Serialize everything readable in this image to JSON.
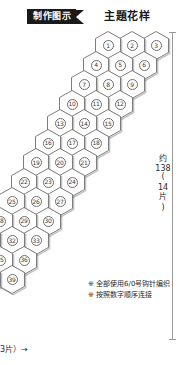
{
  "header": {
    "banner_label": "制作图示",
    "title": "主題花样"
  },
  "diagram": {
    "type": "hexagon-motif-grid",
    "cells_per_row": 3,
    "total_cells": 40,
    "row_x_step": -12,
    "row_y_step": 19.5,
    "hex_width": 25,
    "hex_height": 28,
    "origin_x": 143,
    "origin_y": 31,
    "col_x_step": -24,
    "rows": [
      {
        "index": 0,
        "numbers": [
          "3",
          "2",
          "1"
        ]
      },
      {
        "index": 1,
        "numbers": [
          "6",
          "5",
          "4"
        ]
      },
      {
        "index": 2,
        "numbers": [
          "9",
          "8",
          "7"
        ]
      },
      {
        "index": 3,
        "numbers": [
          "12",
          "11",
          "10"
        ]
      },
      {
        "index": 4,
        "numbers": [
          "15",
          "14",
          "13"
        ]
      },
      {
        "index": 5,
        "numbers": [
          "18",
          "17",
          "16"
        ]
      },
      {
        "index": 6,
        "numbers": [
          "21",
          "20",
          "19"
        ]
      },
      {
        "index": 7,
        "numbers": [
          "24",
          "23",
          "22"
        ]
      },
      {
        "index": 8,
        "numbers": [
          "27",
          "26",
          "25"
        ]
      },
      {
        "index": 9,
        "numbers": [
          "30",
          "29",
          "28"
        ]
      },
      {
        "index": 10,
        "numbers": [
          "33",
          "32",
          "31"
        ]
      },
      {
        "index": 11,
        "numbers": [
          "36",
          "35",
          "34"
        ]
      },
      {
        "index": 12,
        "numbers": [
          "39",
          "38",
          "37"
        ]
      },
      {
        "index": 13,
        "numbers": [
          "",
          "40",
          ""
        ]
      }
    ]
  },
  "measurement": {
    "value_label": "约",
    "value_number": "138",
    "paren_open": "(",
    "count_number": "14",
    "count_unit": "片",
    "paren_close": ")"
  },
  "notes": [
    "※ 全部使用6/0号钩针编织",
    "※ 按照数字顺序连接"
  ],
  "bottom_label": "3片）→",
  "colors": {
    "banner_bg": "#1a1a1a",
    "banner_text": "#ffffff",
    "hex_stroke": "#6e6e6e",
    "hex_shadow": "#8c8c8c",
    "text": "#2a2a2a",
    "measure_line": "#9a9a9a"
  }
}
